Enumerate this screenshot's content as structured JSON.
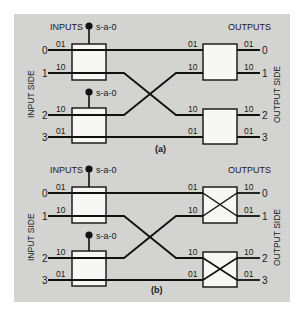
{
  "diagrams": [
    {
      "id": "a",
      "caption": "(a)",
      "inputs_label": "INPUTS",
      "outputs_label": "OUTPUTS",
      "input_side_label": "INPUT SIDE",
      "output_side_label": "OUTPUT SIDE",
      "fault_labels": [
        "s-a-0",
        "s-a-0"
      ],
      "input_ports": [
        "0",
        "1",
        "2",
        "3"
      ],
      "output_ports": [
        "0",
        "1",
        "2",
        "3"
      ],
      "left_box_codes": [
        "01",
        "10",
        "10",
        "01"
      ],
      "right_box_in_codes": [
        "01",
        "10",
        "10",
        "01"
      ],
      "right_box_out_codes": [
        "01",
        "10",
        "10",
        "01"
      ],
      "right_box_state": "straight"
    },
    {
      "id": "b",
      "caption": "(b)",
      "inputs_label": "INPUTS",
      "outputs_label": "OUTPUTS",
      "input_side_label": "INPUT SIDE",
      "output_side_label": "OUTPUT SIDE",
      "fault_labels": [
        "s-a-0",
        "s-a-0"
      ],
      "input_ports": [
        "0",
        "1",
        "2",
        "3"
      ],
      "output_ports": [
        "0",
        "1",
        "2",
        "3"
      ],
      "left_box_codes": [
        "01",
        "10",
        "10",
        "01"
      ],
      "right_box_in_codes": [
        "01",
        "10",
        "10",
        "01"
      ],
      "right_box_out_codes": [
        "10",
        "01",
        "10",
        "01"
      ],
      "right_box_state": "crossed"
    }
  ],
  "colors": {
    "background": "#d3d3d1",
    "line": "#111111",
    "box_fill": "#f7f7f5"
  }
}
